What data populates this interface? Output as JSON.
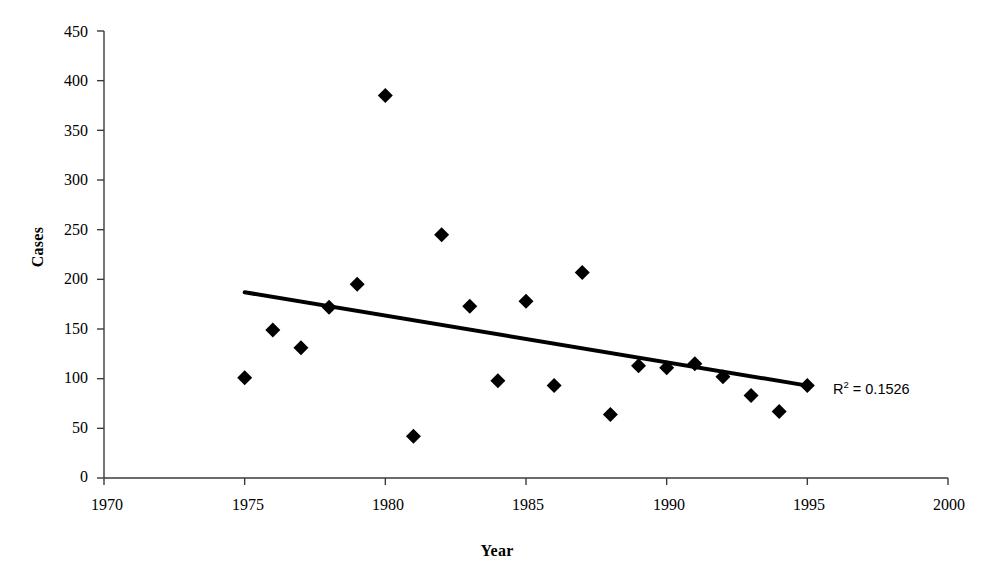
{
  "chart_data": {
    "type": "scatter",
    "title": "",
    "xlabel": "Year",
    "ylabel": "Cases",
    "xlim": [
      1970,
      2000
    ],
    "ylim": [
      0,
      450
    ],
    "xticks": [
      1970,
      1975,
      1980,
      1985,
      1990,
      1995,
      2000
    ],
    "yticks": [
      0,
      50,
      100,
      150,
      200,
      250,
      300,
      350,
      400,
      450
    ],
    "grid": false,
    "legend": null,
    "marker": "filled-diamond",
    "marker_color": "#000000",
    "x": [
      1975,
      1976,
      1977,
      1978,
      1979,
      1980,
      1981,
      1982,
      1983,
      1984,
      1985,
      1986,
      1987,
      1988,
      1989,
      1990,
      1991,
      1992,
      1993,
      1994,
      1995
    ],
    "y": [
      101,
      149,
      131,
      172,
      195,
      385,
      42,
      245,
      173,
      98,
      178,
      93,
      207,
      64,
      113,
      111,
      115,
      102,
      83,
      67,
      93
    ],
    "points": [
      {
        "x": 1975,
        "y": 101
      },
      {
        "x": 1976,
        "y": 149
      },
      {
        "x": 1977,
        "y": 131
      },
      {
        "x": 1978,
        "y": 172
      },
      {
        "x": 1979,
        "y": 195
      },
      {
        "x": 1980,
        "y": 385
      },
      {
        "x": 1981,
        "y": 42
      },
      {
        "x": 1982,
        "y": 245
      },
      {
        "x": 1983,
        "y": 173
      },
      {
        "x": 1984,
        "y": 98
      },
      {
        "x": 1985,
        "y": 178
      },
      {
        "x": 1986,
        "y": 93
      },
      {
        "x": 1987,
        "y": 207
      },
      {
        "x": 1988,
        "y": 64
      },
      {
        "x": 1989,
        "y": 113
      },
      {
        "x": 1990,
        "y": 111
      },
      {
        "x": 1991,
        "y": 115
      },
      {
        "x": 1992,
        "y": 102
      },
      {
        "x": 1993,
        "y": 83
      },
      {
        "x": 1994,
        "y": 67
      },
      {
        "x": 1995,
        "y": 93
      }
    ],
    "trendline": {
      "type": "linear",
      "x_start": 1975,
      "y_start": 187,
      "x_end": 1995,
      "y_end": 93,
      "color": "#000000",
      "width": 4
    },
    "annotations": [
      {
        "name": "r2-annotation",
        "text": "R2 = 0.1526",
        "prefix": "R",
        "superscript": "2",
        "suffix": " = 0.1526",
        "x": 1996,
        "y": 95
      }
    ]
  },
  "axes": {
    "y_label": "Cases",
    "x_label": "Year",
    "y_tick_labels": [
      "450",
      "400",
      "350",
      "300",
      "250",
      "200",
      "150",
      "100",
      "50",
      "0"
    ],
    "x_tick_labels": [
      "1970",
      "1975",
      "1980",
      "1985",
      "1990",
      "1995",
      "2000"
    ]
  },
  "annotation": {
    "r2_prefix": "R",
    "r2_sup": "2",
    "r2_rest": " = 0.1526"
  },
  "colors": {
    "axis": "#3b3b3b",
    "marker": "#000000",
    "trendline": "#000000",
    "background": "#ffffff"
  }
}
